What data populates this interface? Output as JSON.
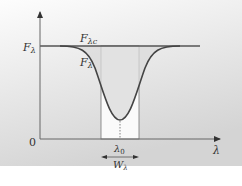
{
  "diagram": {
    "type": "spectral-line-equivalent-width",
    "colors": {
      "background_top": "#fdfdfd",
      "background_bottom": "#d6d6d6",
      "axis": "#666666",
      "curve": "#4a4a4a",
      "continuum": "#555555",
      "rect_fill": "#fafafa",
      "line_fill": "#dcdcdc"
    },
    "labels": {
      "y_axis_value": "F",
      "y_axis_sub": "λ",
      "continuum_main": "F",
      "continuum_sub": "λc",
      "curve_main": "F",
      "curve_sub": "λ",
      "origin": "0",
      "x_axis": "λ",
      "center_main": "λ",
      "center_sub": "0",
      "width_main": "W",
      "width_sub": "λ"
    }
  }
}
